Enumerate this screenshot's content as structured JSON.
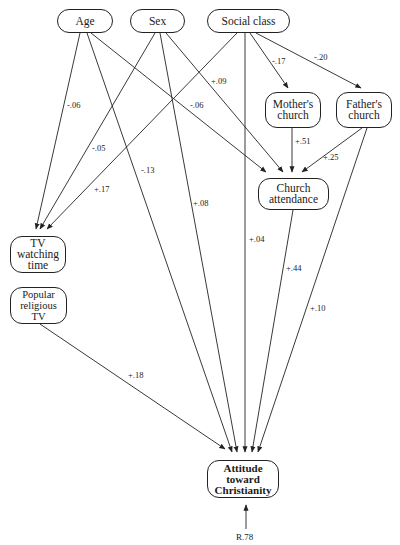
{
  "diagram": {
    "type": "path-diagram",
    "nodes": {
      "age": "Age",
      "sex": "Sex",
      "social_class": "Social class",
      "mothers_church": "Mother's\nchurch",
      "fathers_church": "Father's\nchurch",
      "church_attendance": "Church\nattendance",
      "tv_watching_time": "TV\nwatching\ntime",
      "popular_religious_tv": "Popular\nreligious\nTV",
      "attitude": "Attitude\ntoward\nChristianity"
    },
    "edges": [
      {
        "from": "Age",
        "to": "TV watching time",
        "label": "-.06"
      },
      {
        "from": "Age",
        "to": "Attitude toward Christianity",
        "label": "-.13"
      },
      {
        "from": "Age",
        "to": "Church attendance",
        "label": "-.06"
      },
      {
        "from": "Sex",
        "to": "TV watching time",
        "label": "-.05"
      },
      {
        "from": "Sex",
        "to": "Attitude toward Christianity",
        "label": "+.08"
      },
      {
        "from": "Sex",
        "to": "Church attendance",
        "label": "+.09"
      },
      {
        "from": "Social class",
        "to": "TV watching time",
        "label": "+.17"
      },
      {
        "from": "Social class",
        "to": "Attitude toward Christianity",
        "label": "+.04"
      },
      {
        "from": "Social class",
        "to": "Mother's church",
        "label": "-.17"
      },
      {
        "from": "Social class",
        "to": "Father's church",
        "label": "-.20"
      },
      {
        "from": "Mother's church",
        "to": "Church attendance",
        "label": "+.51"
      },
      {
        "from": "Father's church",
        "to": "Church attendance",
        "label": "+.25"
      },
      {
        "from": "Father's church",
        "to": "Attitude toward Christianity",
        "label": "+.10"
      },
      {
        "from": "Church attendance",
        "to": "Attitude toward Christianity",
        "label": "+.44"
      },
      {
        "from": "Popular religious TV",
        "to": "Attitude toward Christianity",
        "label": "+.18"
      }
    ],
    "labels": {
      "age_tv": "-.06",
      "age_att": "-.13",
      "age_church": "-.06",
      "sex_tv": "-.05",
      "sex_att": "+.08",
      "sex_church": "+.09",
      "sc_tv": "+.17",
      "sc_att": "+.04",
      "sc_mother": "-.17",
      "sc_father": "-.20",
      "mother_church": "+.51",
      "father_church": "+.25",
      "father_att": "+.10",
      "church_att": "+.44",
      "poptv_att": "+.18"
    },
    "residual": "R.78"
  }
}
